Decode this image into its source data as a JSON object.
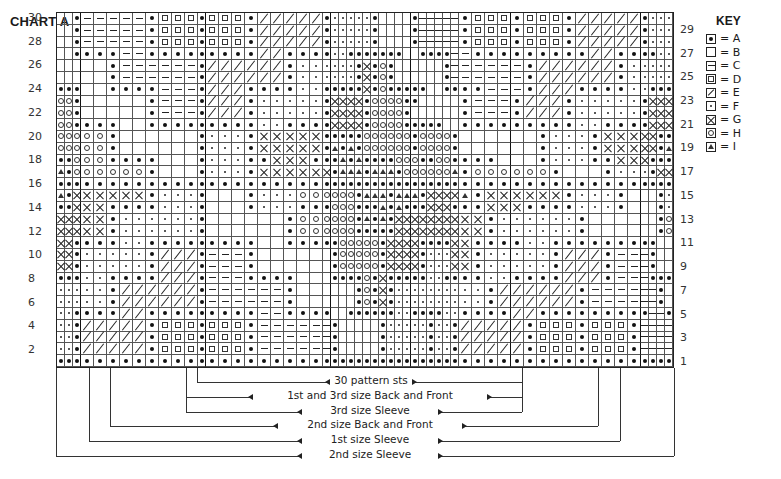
{
  "title": "CHART A",
  "key": {
    "title": "KEY",
    "items": [
      {
        "symbol": "A",
        "icon": "filled-dot-icon",
        "label": "= A"
      },
      {
        "symbol": "B",
        "icon": "blank-square-icon",
        "label": "= B"
      },
      {
        "symbol": "C",
        "icon": "dash-icon",
        "label": "= C"
      },
      {
        "symbol": "D",
        "icon": "small-square-icon",
        "label": "= D"
      },
      {
        "symbol": "E",
        "icon": "diagonal-slash-icon",
        "label": "= E"
      },
      {
        "symbol": "F",
        "icon": "small-dot-icon",
        "label": "= F"
      },
      {
        "symbol": "G",
        "icon": "cross-x-icon",
        "label": "= G"
      },
      {
        "symbol": "H",
        "icon": "open-circle-icon",
        "label": "= H"
      },
      {
        "symbol": "I",
        "icon": "triangle-icon",
        "label": "= I"
      }
    ]
  },
  "row_labels_left": [
    "30",
    "28",
    "26",
    "24",
    "22",
    "20",
    "18",
    "16",
    "14",
    "12",
    "10",
    "8",
    "6",
    "4",
    "2"
  ],
  "row_labels_right": [
    "29",
    "27",
    "25",
    "23",
    "21",
    "19",
    "17",
    "15",
    "13",
    "11",
    "9",
    "7",
    "5",
    "3",
    "1"
  ],
  "grid": {
    "columns": 57,
    "rows_count": 30,
    "repeat_start_col": 13,
    "repeat_width": 30,
    "rows_top_to_bottom": [
      "BBACCCCCADDDADDDAEEEEEAFFFFFABBBBACCCCCADDDADDDAEEEEEAFFF",
      "BBACCCCCADDDADDDAEEEEEAFFFFFABBBBACCCCCADDDADDDAEEEEEAFFF",
      "BBACCCCCADDDADDDAEEEEEAFFFFFABBBBACCCCCADDDADDDAEEEEEAFFF",
      "BBAAAACCAAAAAAAAAEEAAAAFFAAAAAAABBAAAACCAAAAAAAAAEEAAAAFF",
      "BBBBBACCCCCCAEEEEEEAFFFFFFAGAHABBBBBBACCCCCCAEEEEEEAFFFFF",
      "BBBBBACCCCCCAEEEEEEAFFFFFFAGAHABBBBBBACCCCCCAEEEEEEAFFFFF",
      "AAABBAAAACCCAEEEAAAAFFAAAAAGAHAAAAABBAAAACCCAEEEAAAAFFAAA",
      "HHABBBBBACCCAEEEAFFFFFAGGGGAHHHHAABBBBBACCCAEEEAFFFFFAGGG",
      "HHABBBBBACCCAEEEAFFFFFAGGGGAHHHHABBBBBBACCCAEEEAFFFFFAGGG",
      "HHAAAABBAAAAAAAAAFFAAAAGGGGAHHHHAAAAABBAAAAAAAAAFFAAAAGGG",
      "HHHHHABBBBBBAFFFAGGGGGAAAAAHHHHHHAHHHHABBBBBBAFFFAGGGGGAA",
      "HHHHHABBBBBBAFFFAGGGGGAIAIAHHHHHHAHHHHABBBBBBAFFFAGGGGGAI",
      "AAHHHAAAABBBAFFFAAGGGAAAIAIAAAAHHHAAHHAAAABBBAFFFAAGGGAAA",
      "IAHHHHHHABBBAFFFAGGGGGGAIIIAIIIAHHHHHHIAHHHHHHABBBAFFFAGG",
      "AAAAAAAAAAAAAAAAAAAAAAAAAAAAAAAAAAAAAAAAAAAAAAAAAAAAAAAAA",
      "IAGGGGGGAFFFABBBAFFFHHHHHHAIIIAIIIAGGGGIAGGGGGGAFFFABBBAF",
      "AAGGGAAAAFFFABBBAFFFAAAHHHAAAIAIAAAGGGAAAGGGAAAAFFFABBBAF",
      "GGGGGAFFFFFFABBBBBBAHHHHHHAIAIAGGGGGGGGGGAFFFFFFABBBBBBAH",
      "GGGGGAFFFFFFABBBBBBAHHHHHHAAAAAGGGGGGGGGGAFFFFFFABBBBBBAH",
      "GGAAAAFFAAAAAAAAABBAAAAAHHHHHAGGGGAAAAGGAAAAFFAAAAAAAAABB",
      "GGAFFFFFAEEEACCCABBBBBBAHHHHHAGGGGAFFFGGAFFFFFAEEEACCCABB",
      "GGAFFFFFAEEEACCCABBBBBBAHHHHHAGGGGAFFFGGAFFFFFAEEEACCCABB",
      "AAAFFAAAAEEEACCCAAAABBBAAAAHAGAAAAAFFAAAAFFAAAAEEEACCCAAA",
      "FFFFFAEEEEEEACCCCCCABBBBBBAHAGAFFFFFFFFFFAEEEEEEACCCCCCAB",
      "FFFFFAEEEEEEACCCCCCABBBBBBAHAGAFFFFFFFFFFAEEEEEEACCCCCCAB",
      "FFAAAAEEAAAAAAAAACCAAAABBAAAAAAFFAAAAFFAAAAEEAAAAAAAAACCA",
      "FFAEEEEEADDDADDDACCCCCCABBBBBAFFFFFAFFAEEEEEADDDADDDACCCC",
      "FFAEEEEEADDDADDDACCCCCCABBBBBAFFFFFAFFAEEEEEADDDADDDACCCC",
      "FFAEEEEEADDDADDDACCCCCCABBBBBAFFFFFAFFAEEEEEADDDADDDACCCC",
      "AAAAAAAAAAAAAAAAAAAAAAAAAAAAAAAAAAAAAAAAAAAAAAAAAAAAAAAAA"
    ]
  },
  "brackets": [
    {
      "label": "30 pattern sts",
      "left_col": 13,
      "right_col": 43
    },
    {
      "label": "1st and 3rd size Back and Front",
      "left_col": 12,
      "right_col": 43
    },
    {
      "label": "3rd size Sleeve",
      "left_col": 12,
      "right_col": 43
    },
    {
      "label": "2nd size Back and Front",
      "left_col": 5,
      "right_col": 50
    },
    {
      "label": "1st size Sleeve",
      "left_col": 3,
      "right_col": 52
    },
    {
      "label": "2nd size Sleeve",
      "left_col": 0,
      "right_col": 57
    }
  ]
}
